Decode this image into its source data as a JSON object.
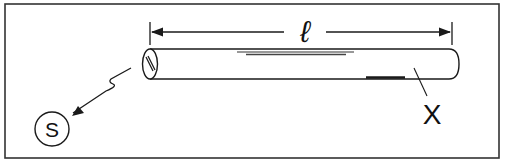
{
  "diagram": {
    "frame": {
      "stroke": "#333333"
    },
    "dimension": {
      "label": "ℓ",
      "meaning": "length of tube"
    },
    "tube": {
      "end_label": "X"
    },
    "source": {
      "label": "S"
    },
    "colors": {
      "ink": "#1a1a1a",
      "background": "#ffffff"
    }
  }
}
